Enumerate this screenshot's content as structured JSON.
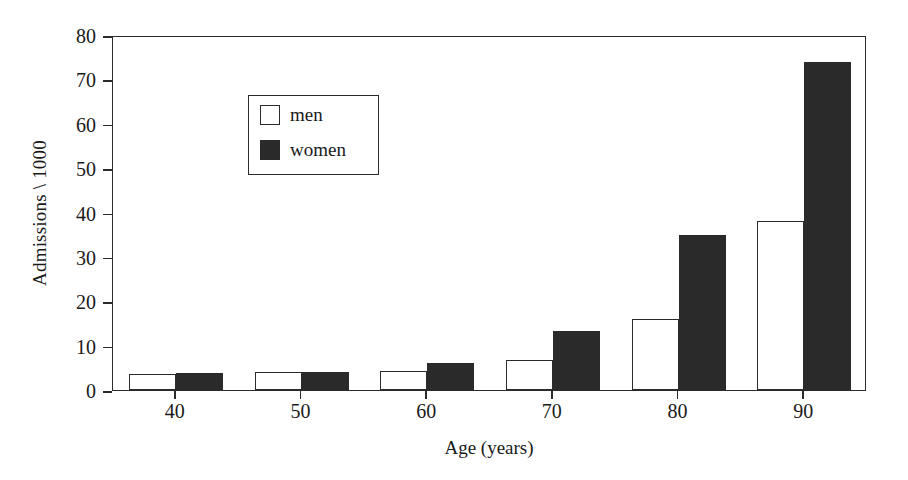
{
  "chart_data": {
    "type": "bar",
    "title": "",
    "xlabel": "Age (years)",
    "ylabel": "Admissions \\ 1000",
    "categories": [
      "40",
      "50",
      "60",
      "70",
      "80",
      "90"
    ],
    "series": [
      {
        "name": "men",
        "color": "#ffffff",
        "values": [
          3.5,
          4.0,
          4.2,
          6.7,
          16.0,
          38.0
        ]
      },
      {
        "name": "women",
        "color": "#2a2a2a",
        "values": [
          3.8,
          4.1,
          6.2,
          13.2,
          35.0,
          74.0
        ]
      }
    ],
    "ylim": [
      0,
      80
    ],
    "ytick_labels": [
      "0",
      "10",
      "20",
      "30",
      "40",
      "50",
      "60",
      "70",
      "80"
    ],
    "ytick_values": [
      0,
      10,
      20,
      30,
      40,
      50,
      60,
      70,
      80
    ],
    "xtick_labels": [
      "40",
      "50",
      "60",
      "70",
      "80",
      "90"
    ],
    "grid": false,
    "legend_position": "upper-left",
    "legend_entries": [
      "men",
      "women"
    ]
  },
  "figure": {
    "background": "#ffffff",
    "frame_color": "#2b2b2b",
    "text_color": "#1a1a1a"
  }
}
